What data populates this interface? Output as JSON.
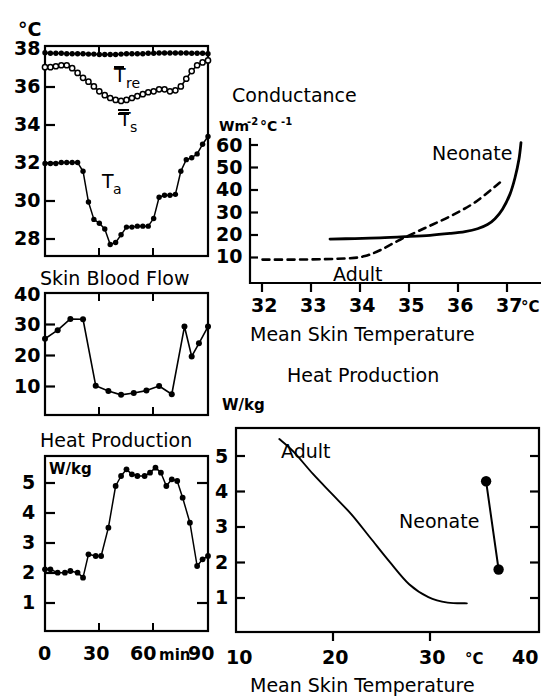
{
  "figure": {
    "width": 558,
    "height": 700,
    "background": "#ffffff",
    "ink": "#000000"
  },
  "panels": {
    "temperatures": {
      "title": "",
      "y_unit": "°C",
      "y_ticks": [
        "38",
        "36",
        "34",
        "32",
        "30",
        "28"
      ],
      "series_labels": {
        "rectal": "T",
        "rectal_sub": "re",
        "skin": "T",
        "skin_sub": "s"
      }
    },
    "skin_blood_flow": {
      "title": "Skin Blood Flow",
      "y_ticks": [
        "40",
        "30",
        "20",
        "10"
      ]
    },
    "heat_production_time": {
      "title": "Heat Production",
      "y_unit": "W/kg",
      "y_ticks": [
        "5",
        "4",
        "3",
        "2",
        "1"
      ],
      "x_ticks": [
        "0",
        "30",
        "60",
        "90"
      ],
      "x_unit": "min"
    },
    "conductance": {
      "title": "Conductance",
      "y_unit_main": "Wm",
      "y_unit_sup1": "-2",
      "y_unit_mid": "°C",
      "y_unit_sup2": "-1",
      "y_ticks": [
        "60",
        "50",
        "40",
        "30",
        "20",
        "10"
      ],
      "x_ticks": [
        "32",
        "33",
        "34",
        "35",
        "36",
        "37"
      ],
      "x_unit": "°C",
      "xlabel": "Mean Skin Temperature",
      "curve_labels": {
        "neonate": "Neonate",
        "adult": "Adult"
      }
    },
    "heat_production_temp": {
      "title": "Heat Production",
      "y_unit": "W/kg",
      "y_ticks": [
        "5",
        "4",
        "3",
        "2",
        "1"
      ],
      "x_ticks": [
        "10",
        "20",
        "30",
        "40"
      ],
      "x_unit": "°C",
      "xlabel": "Mean Skin Temperature",
      "curve_labels": {
        "adult": "Adult",
        "neonate": "Neonate"
      }
    }
  },
  "chart_data": [
    {
      "id": "temperatures",
      "type": "line",
      "title": "",
      "xlabel": "time (min)",
      "ylabel": "°C",
      "xlim": [
        0,
        90
      ],
      "ylim": [
        27.2,
        38.1
      ],
      "grid": false,
      "legend": "inline-labels",
      "x": [
        0,
        3,
        6,
        9,
        12,
        15,
        18,
        21,
        24,
        27,
        30,
        33,
        36,
        39,
        42,
        45,
        48,
        51,
        54,
        57,
        60,
        63,
        66,
        69,
        72,
        75,
        78,
        81,
        84,
        87,
        90
      ],
      "series": [
        {
          "name": "T_re",
          "marker": "filled-circle",
          "values": [
            37.75,
            37.72,
            37.72,
            37.72,
            37.7,
            37.7,
            37.7,
            37.7,
            37.68,
            37.68,
            37.66,
            37.66,
            37.66,
            37.66,
            37.68,
            37.7,
            37.7,
            37.7,
            37.7,
            37.72,
            37.72,
            37.74,
            37.74,
            37.74,
            37.74,
            37.74,
            37.74,
            37.72,
            37.72,
            37.72,
            37.7
          ]
        },
        {
          "name": "T_s",
          "marker": "open-circle",
          "values": [
            37.0,
            37.0,
            37.05,
            37.1,
            37.1,
            36.95,
            36.7,
            36.45,
            36.25,
            36.0,
            35.75,
            35.55,
            35.4,
            35.3,
            35.25,
            35.3,
            35.4,
            35.5,
            35.6,
            35.7,
            35.75,
            35.85,
            35.85,
            35.75,
            35.8,
            36.0,
            36.4,
            36.8,
            37.1,
            37.25,
            37.35
          ]
        },
        {
          "name": "T_a",
          "marker": "filled-circle",
          "values": [
            32.0,
            32.0,
            32.0,
            32.05,
            32.05,
            32.05,
            32.05,
            31.6,
            30.0,
            29.1,
            28.9,
            28.6,
            27.8,
            27.9,
            28.3,
            28.7,
            28.7,
            28.75,
            28.75,
            28.75,
            29.15,
            30.25,
            30.35,
            30.35,
            30.4,
            31.6,
            32.2,
            32.3,
            32.5,
            33.0,
            33.4
          ]
        }
      ]
    },
    {
      "id": "skin_blood_flow",
      "type": "line",
      "title": "Skin Blood Flow",
      "xlabel": "time (min)",
      "ylabel": "",
      "xlim": [
        0,
        90
      ],
      "ylim": [
        0,
        40
      ],
      "grid": false,
      "marker": "filled-circle",
      "x": [
        0,
        7,
        14,
        21,
        28,
        35,
        42,
        49,
        56,
        63,
        70,
        77,
        81,
        85,
        90
      ],
      "values": [
        25.0,
        27.8,
        31.5,
        31.4,
        9.6,
        7.9,
        6.6,
        7.2,
        8.0,
        9.5,
        6.8,
        29.0,
        19.2,
        23.5,
        29.0
      ]
    },
    {
      "id": "heat_production_time",
      "type": "line",
      "title": "Heat Production",
      "xlabel": "min",
      "ylabel": "W/kg",
      "xlim": [
        0,
        90
      ],
      "ylim": [
        0.35,
        5.6
      ],
      "grid": false,
      "marker": "filled-circle",
      "x": [
        0,
        3,
        7,
        11,
        14,
        18,
        21,
        24,
        28,
        31,
        35,
        39,
        42,
        45,
        48,
        51,
        55,
        58,
        61,
        64,
        67,
        70,
        73,
        76,
        80,
        84,
        87,
        90
      ],
      "values": [
        2.2,
        2.2,
        2.1,
        2.1,
        2.15,
        2.1,
        1.95,
        2.65,
        2.6,
        2.6,
        3.45,
        4.7,
        5.0,
        5.2,
        5.05,
        5.0,
        5.0,
        5.1,
        5.25,
        5.1,
        4.7,
        4.9,
        4.85,
        4.35,
        3.6,
        2.3,
        2.5,
        2.6
      ]
    },
    {
      "id": "conductance",
      "type": "line",
      "title": "Conductance",
      "xlabel": "Mean Skin Temperature",
      "ylabel": "Wm-2 °C-1",
      "xlim": [
        31.7,
        37.6
      ],
      "ylim": [
        0,
        62
      ],
      "grid": false,
      "series": [
        {
          "name": "Neonate",
          "style": "solid",
          "x": [
            33.3,
            33.8,
            34.3,
            34.8,
            35.3,
            35.7,
            36.0,
            36.25,
            36.45,
            36.6,
            36.75,
            36.9,
            37.0,
            37.08,
            37.12
          ],
          "values": [
            18.8,
            19.0,
            19.3,
            19.8,
            20.4,
            21.2,
            22.0,
            23.2,
            25.0,
            27.5,
            31.5,
            38.0,
            45.0,
            53.0,
            60.0
          ]
        },
        {
          "name": "Adult",
          "style": "dashed",
          "x": [
            31.95,
            32.6,
            33.2,
            33.7,
            34.0,
            34.3,
            34.7,
            35.2,
            35.7,
            36.2,
            36.7
          ],
          "values": [
            10.0,
            10.0,
            10.2,
            10.6,
            11.5,
            14.0,
            18.5,
            23.5,
            28.5,
            34.5,
            43.0
          ]
        }
      ]
    },
    {
      "id": "heat_production_temp",
      "type": "line",
      "title": "Heat Production",
      "xlabel": "Mean Skin Temperature",
      "ylabel": "W/kg",
      "xlim": [
        9.0,
        40.5
      ],
      "ylim": [
        0.3,
        5.85
      ],
      "grid": false,
      "series": [
        {
          "name": "Adult",
          "style": "solid",
          "x": [
            13.5,
            15,
            17,
            19,
            21,
            23,
            25,
            27,
            29,
            31,
            33
          ],
          "values": [
            5.55,
            5.2,
            4.6,
            4.05,
            3.5,
            2.85,
            2.2,
            1.6,
            1.25,
            1.1,
            1.08
          ]
        },
        {
          "name": "Neonate",
          "style": "solid-with-markers",
          "marker": "filled-circle",
          "x": [
            35.0,
            36.3
          ],
          "values": [
            4.4,
            2.0
          ]
        }
      ]
    }
  ]
}
